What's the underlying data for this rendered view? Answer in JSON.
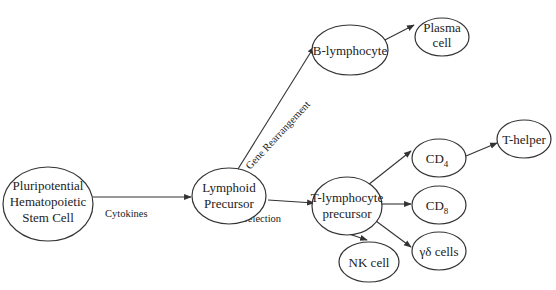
{
  "diagram": {
    "nodes": {
      "stem_cell": {
        "lines": [
          "Pluripotential",
          "Hematopoietic",
          "Stem Cell"
        ]
      },
      "lymphoid": {
        "lines": [
          "Lymphoid",
          "Precursor"
        ]
      },
      "b_lymph": {
        "lines": [
          "B-lymphocyte"
        ]
      },
      "plasma": {
        "lines": [
          "Plasma",
          "cell"
        ]
      },
      "t_prec": {
        "lines": [
          "T-lymphocyte",
          "precursor"
        ]
      },
      "cd4": {
        "main": "CD",
        "sub": "4"
      },
      "cd8": {
        "main": "CD",
        "sub": "8"
      },
      "t_helper": {
        "lines": [
          "T-helper"
        ]
      },
      "gd": {
        "lines": [
          "γδ cells"
        ]
      },
      "nk": {
        "lines": [
          "NK cell"
        ]
      }
    },
    "edges": {
      "cytokines": "Cytokines",
      "gene_rearrangement": "Gene Rearrangement",
      "selection": "Selection"
    }
  }
}
